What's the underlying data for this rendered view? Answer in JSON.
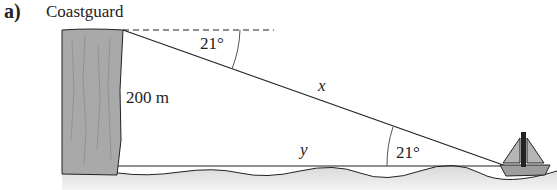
{
  "part_label": "a)",
  "title": "Coastguard",
  "labels": {
    "height": "200 m",
    "hypotenuse": "x",
    "base": "y",
    "angle_top": "21°",
    "angle_bottom": "21°"
  },
  "colors": {
    "cliff": "#a9a9a9",
    "sea": "#e2e2e2",
    "sail": "#9d9d9d",
    "line": "#222222"
  }
}
